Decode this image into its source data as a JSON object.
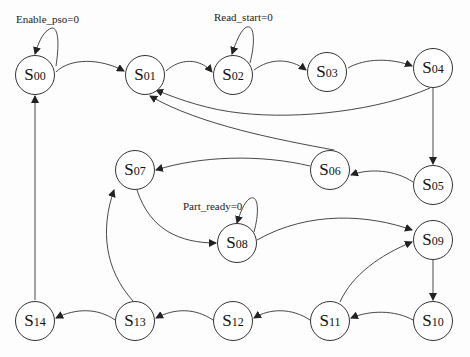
{
  "diagram": {
    "type": "state-machine",
    "nodes": [
      {
        "id": "S00",
        "prefix": "S",
        "num": "00",
        "x": 35,
        "y": 75
      },
      {
        "id": "S01",
        "prefix": "S",
        "num": "01",
        "x": 145,
        "y": 75
      },
      {
        "id": "S02",
        "prefix": "S",
        "num": "02",
        "x": 233,
        "y": 75
      },
      {
        "id": "S03",
        "prefix": "S",
        "num": "03",
        "x": 327,
        "y": 72
      },
      {
        "id": "S04",
        "prefix": "S",
        "num": "04",
        "x": 433,
        "y": 68
      },
      {
        "id": "S05",
        "prefix": "S",
        "num": "05",
        "x": 433,
        "y": 185
      },
      {
        "id": "S06",
        "prefix": "S",
        "num": "06",
        "x": 330,
        "y": 170
      },
      {
        "id": "S07",
        "prefix": "S",
        "num": "07",
        "x": 135,
        "y": 170
      },
      {
        "id": "S08",
        "prefix": "S",
        "num": "08",
        "x": 237,
        "y": 243
      },
      {
        "id": "S09",
        "prefix": "S",
        "num": "09",
        "x": 433,
        "y": 240
      },
      {
        "id": "S10",
        "prefix": "S",
        "num": "10",
        "x": 433,
        "y": 321
      },
      {
        "id": "S11",
        "prefix": "S",
        "num": "11",
        "x": 330,
        "y": 321
      },
      {
        "id": "S12",
        "prefix": "S",
        "num": "12",
        "x": 233,
        "y": 321
      },
      {
        "id": "S13",
        "prefix": "S",
        "num": "13",
        "x": 135,
        "y": 321
      },
      {
        "id": "S14",
        "prefix": "S",
        "num": "14",
        "x": 35,
        "y": 321
      }
    ],
    "edges": [
      {
        "from": "S00",
        "to": "S00",
        "label": "Enable_pso=0",
        "self_loop": true
      },
      {
        "from": "S00",
        "to": "S01"
      },
      {
        "from": "S01",
        "to": "S02"
      },
      {
        "from": "S02",
        "to": "S02",
        "label": "Read_start=0",
        "self_loop": true
      },
      {
        "from": "S02",
        "to": "S03"
      },
      {
        "from": "S03",
        "to": "S04"
      },
      {
        "from": "S04",
        "to": "S01"
      },
      {
        "from": "S04",
        "to": "S05"
      },
      {
        "from": "S05",
        "to": "S06"
      },
      {
        "from": "S06",
        "to": "S01"
      },
      {
        "from": "S06",
        "to": "S07"
      },
      {
        "from": "S07",
        "to": "S08"
      },
      {
        "from": "S08",
        "to": "S08",
        "label": "Part_ready=0",
        "self_loop": true
      },
      {
        "from": "S08",
        "to": "S09"
      },
      {
        "from": "S09",
        "to": "S10"
      },
      {
        "from": "S10",
        "to": "S11"
      },
      {
        "from": "S11",
        "to": "S09"
      },
      {
        "from": "S11",
        "to": "S12"
      },
      {
        "from": "S12",
        "to": "S13"
      },
      {
        "from": "S13",
        "to": "S07"
      },
      {
        "from": "S13",
        "to": "S14"
      },
      {
        "from": "S14",
        "to": "S00"
      }
    ],
    "labels": {
      "enable_pso": "Enable_pso=0",
      "read_start": "Read_start=0",
      "part_ready": "Part_ready=0"
    },
    "colors": {
      "stroke": "#333333",
      "background": "#fdfdfd"
    }
  }
}
